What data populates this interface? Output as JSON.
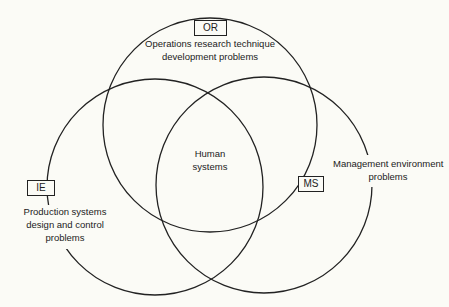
{
  "diagram": {
    "type": "venn",
    "sets": [
      {
        "id": "OR",
        "label": "OR",
        "description": "Operations research technique development problems",
        "description_lines": [
          "Operations research technique",
          "development problems"
        ]
      },
      {
        "id": "IE",
        "label": "IE",
        "description": "Production systems design and control problems",
        "description_lines": [
          "Production systems",
          "design and control",
          "problems"
        ]
      },
      {
        "id": "MS",
        "label": "MS",
        "description": "Management environment problems",
        "description_lines": [
          "Management environment",
          "problems"
        ]
      }
    ],
    "center": {
      "label": "Human systems",
      "lines": [
        "Human",
        "systems"
      ]
    },
    "colors": {
      "stroke": "#222222",
      "background": "#fbfbf6"
    }
  }
}
